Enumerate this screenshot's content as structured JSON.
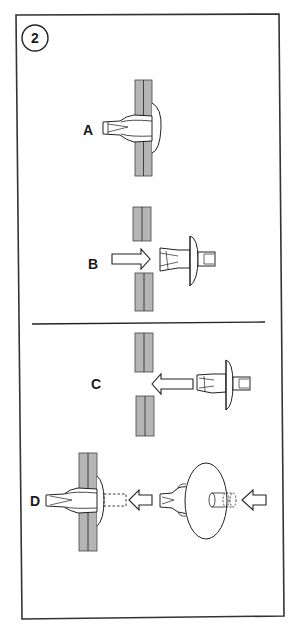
{
  "figure": {
    "step_number": "2",
    "frame": {
      "stroke": "#333333"
    },
    "panel_fill": "#b5b5b5",
    "line_color": "#222222"
  },
  "steps": [
    {
      "id": "A",
      "label": "A",
      "description": "Push-type retainer clip installed through panel"
    },
    {
      "id": "B",
      "label": "B",
      "description": "Clip inserted toward hole in panel (arrow pointing left-to-right)"
    },
    {
      "id": "C",
      "label": "C",
      "description": "Clip approaching hole from right (arrow pointing left)"
    },
    {
      "id": "D",
      "label": "D",
      "description": "Center pin pushed in to lock clip; second view shows pin being pushed into clip head"
    }
  ]
}
